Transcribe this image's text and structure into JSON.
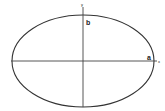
{
  "diagram": {
    "title": "",
    "shape": "ellipse",
    "labels": {
      "semi_major": "a",
      "semi_minor": "b",
      "x_axis": "x",
      "y_axis": "y"
    },
    "colors": {
      "stroke": "#333333",
      "axis": "#444444",
      "background": "#ffffff"
    }
  }
}
